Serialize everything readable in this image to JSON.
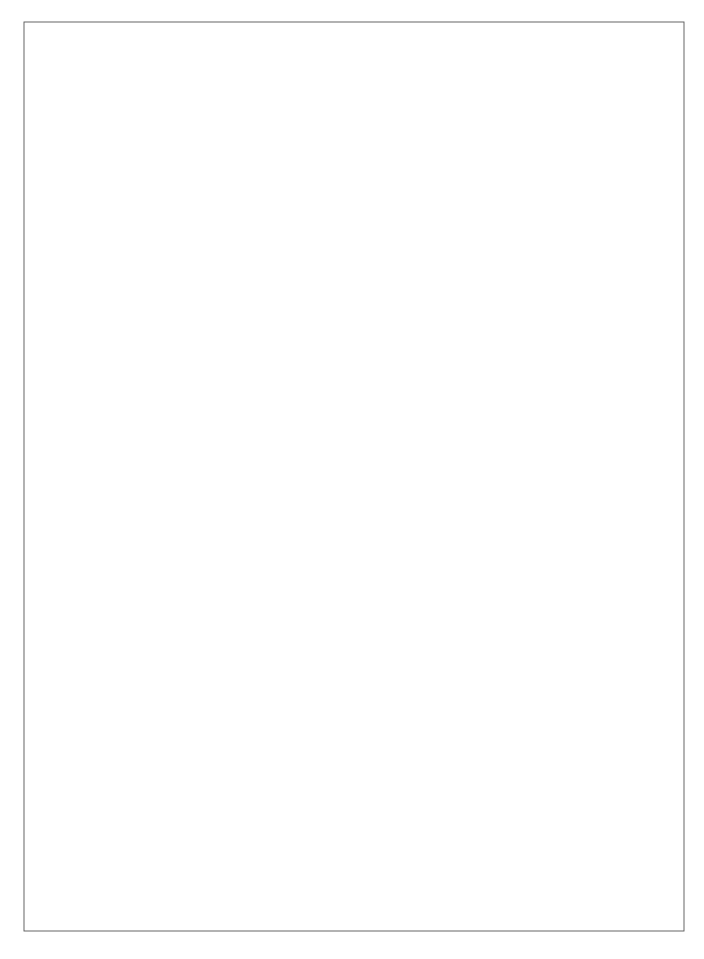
{
  "document": {
    "title": "Geometric Tessellation Line Drawing",
    "page_width": 704,
    "page_height": 959,
    "background_color": "#ffffff"
  },
  "frame": {
    "name": "pattern-border",
    "x": 24,
    "y": 22,
    "width": 660,
    "height": 909,
    "stroke_color": "#555555",
    "stroke_width": 0.9,
    "fill": "none"
  },
  "pattern": {
    "name": "islamic-star-tessellation",
    "description": "Repeating tessellation of 12-ray star rosettes on a staggered rectangular lattice, with interlocking diamonds, kites and triangles filling the interstitial regions.",
    "line_color": "#3a3a3a",
    "line_width": 0.8,
    "axis_line_color": "#555555",
    "axis_line_width": 1.0,
    "node_color": "#1a1a1a",
    "star_node_radius": 2.6,
    "minor_node_radius": 1.3,
    "lattice": {
      "cell_width": 131,
      "cell_height": 137,
      "row_offset_x": 65.5,
      "origin_x": 90,
      "origin_y": 67,
      "star_rays": 12,
      "rosette_radius": 65.5
    },
    "star_centers_cols": 6,
    "star_centers_rows": 8
  }
}
